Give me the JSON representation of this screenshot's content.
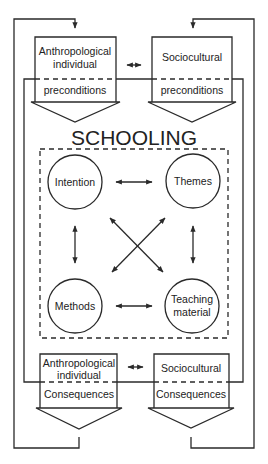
{
  "diagram": {
    "title": "SCHOOLING",
    "colors": {
      "stroke": "#2a2a2a",
      "text": "#222222",
      "background": "#ffffff"
    },
    "preconditions": {
      "left": {
        "line1": "Anthropological",
        "line2": "individual",
        "line3": "preconditions"
      },
      "right": {
        "line1": "Sociocultural",
        "line3": "preconditions"
      },
      "connector": "double-arrow-icon"
    },
    "core": {
      "nodes": [
        {
          "id": "intention",
          "line1": "Intention"
        },
        {
          "id": "themes",
          "line1": "Themes"
        },
        {
          "id": "methods",
          "line1": "Methods"
        },
        {
          "id": "teaching-material",
          "line1": "Teaching",
          "line2": "material"
        }
      ],
      "edges": [
        [
          "intention",
          "themes"
        ],
        [
          "intention",
          "methods"
        ],
        [
          "themes",
          "teaching-material"
        ],
        [
          "methods",
          "teaching-material"
        ],
        [
          "intention",
          "teaching-material"
        ],
        [
          "themes",
          "methods"
        ]
      ]
    },
    "consequences": {
      "left": {
        "line1": "Anthropological",
        "line2": "individual",
        "line3": "Consequences"
      },
      "right": {
        "line1": "Sociocultural",
        "line3": "Consequences"
      },
      "connector": "double-arrow-icon"
    }
  }
}
